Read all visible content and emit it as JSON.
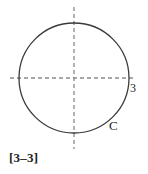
{
  "figure": {
    "caption": "[3–3]",
    "background_color": "#ffffff",
    "stroke_color": "#3a3a3a",
    "axis_color": "#8a8a8a",
    "text_color": "#231f20",
    "labels": {
      "radius": "3",
      "curve": "C"
    },
    "icons": {
      "circle": "circle-outline-icon",
      "x_axis": "dashed-horizontal-axis-icon",
      "y_axis": "dashed-vertical-axis-icon"
    },
    "geometry": {
      "center_x": 74,
      "center_y": 78,
      "radius": 55,
      "x_axis_start": 10,
      "x_axis_end": 134,
      "y_axis_start": 7,
      "y_axis_end": 149,
      "dash_pattern": "4 3"
    }
  }
}
